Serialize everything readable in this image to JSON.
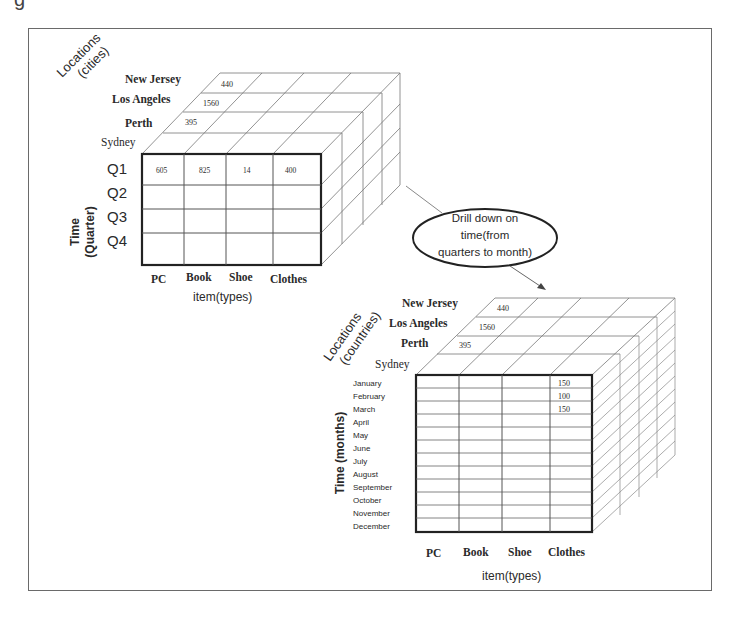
{
  "figure": {
    "partial_glyph": "g",
    "cube_cities": {
      "depth_axis_label_line1": "Locations",
      "depth_axis_label_line2": "(cities)",
      "depth_members": [
        "New Jersey",
        "Los Angeles",
        "Perth",
        "Sydney"
      ],
      "top_values": [
        "440",
        "1560",
        "395"
      ],
      "time_axis_label_line1": "Time",
      "time_axis_label_line2": "(Quarter)",
      "time_members": [
        "Q1",
        "Q2",
        "Q3",
        "Q4"
      ],
      "item_members": [
        "PC",
        "Book",
        "Shoe",
        "Clothes"
      ],
      "item_axis_label": "item(types)",
      "q1_values": [
        "605",
        "825",
        "14",
        "400"
      ]
    },
    "annotation": {
      "line1": "Drill down on",
      "line2": "time(from",
      "line3": "quarters to month)"
    },
    "cube_countries": {
      "depth_axis_label_line1": "Locations",
      "depth_axis_label_line2": "(countries)",
      "depth_members": [
        "New Jersey",
        "Los Angeles",
        "Perth",
        "Sydney"
      ],
      "top_values": [
        "440",
        "1560",
        "395"
      ],
      "time_axis_label": "Time (months)",
      "time_members": [
        "January",
        "February",
        "March",
        "April",
        "May",
        "June",
        "July",
        "August",
        "September",
        "October",
        "November",
        "December"
      ],
      "item_members": [
        "PC",
        "Book",
        "Shoe",
        "Clothes"
      ],
      "item_axis_label": "item(types)",
      "clothes_values": [
        "150",
        "100",
        "150"
      ]
    }
  }
}
